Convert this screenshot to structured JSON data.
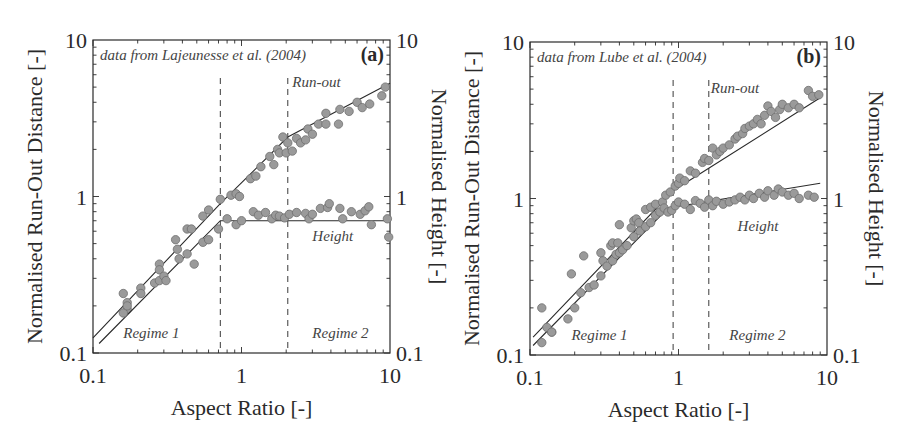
{
  "chart_data": [
    {
      "id": "a",
      "type": "scatter",
      "panel_label": "(a)",
      "source_note": "data from Lajeunesse et al. (2004)",
      "xlabel": "Aspect Ratio [-]",
      "ylabel_left": "Normalised Run-Out Distance [-]",
      "ylabel_right": "Normalised Height [-]",
      "xscale": "log",
      "yscale": "log",
      "xlim": [
        0.1,
        10
      ],
      "ylim": [
        0.1,
        10
      ],
      "x_ticks": [
        "0.1",
        "1",
        "10"
      ],
      "y_ticks_left": [
        "0.1",
        "1",
        "10"
      ],
      "y_ticks_right": [
        "0.1",
        "1",
        "10"
      ],
      "grid": false,
      "regime_boundaries": [
        0.72,
        2.05
      ],
      "annotations": [
        {
          "text": "Run-out",
          "x": 2.2,
          "y": 5.0
        },
        {
          "text": "Height",
          "x": 3.0,
          "y": 0.52
        },
        {
          "text": "Regime 1",
          "x": 0.16,
          "y": 0.125
        },
        {
          "text": "Regime 2",
          "x": 3.0,
          "y": 0.125
        }
      ],
      "series": [
        {
          "name": "Run-out",
          "fit": [
            [
              0.1,
              0.125
            ],
            [
              0.72,
              0.9
            ],
            [
              2.05,
              2.4
            ],
            [
              10,
              5.3
            ]
          ],
          "points": [
            [
              0.16,
              0.24
            ],
            [
              0.17,
              0.21
            ],
            [
              0.17,
              0.19
            ],
            [
              0.21,
              0.26
            ],
            [
              0.28,
              0.37
            ],
            [
              0.28,
              0.34
            ],
            [
              0.36,
              0.53
            ],
            [
              0.37,
              0.46
            ],
            [
              0.43,
              0.62
            ],
            [
              0.46,
              0.62
            ],
            [
              0.55,
              0.75
            ],
            [
              0.6,
              0.82
            ],
            [
              0.72,
              0.96
            ],
            [
              0.85,
              1.02
            ],
            [
              0.92,
              1.04
            ],
            [
              0.97,
              1.0
            ],
            [
              1.15,
              1.3
            ],
            [
              1.25,
              1.35
            ],
            [
              1.35,
              1.55
            ],
            [
              1.55,
              1.8
            ],
            [
              1.65,
              1.6
            ],
            [
              1.75,
              2.0
            ],
            [
              1.8,
              1.9
            ],
            [
              1.9,
              2.4
            ],
            [
              2.0,
              1.9
            ],
            [
              2.05,
              2.2
            ],
            [
              2.2,
              1.95
            ],
            [
              2.35,
              2.35
            ],
            [
              2.5,
              2.2
            ],
            [
              2.7,
              2.3
            ],
            [
              2.8,
              2.7
            ],
            [
              3.0,
              2.5
            ],
            [
              3.3,
              2.9
            ],
            [
              3.7,
              3.4
            ],
            [
              3.7,
              2.9
            ],
            [
              4.5,
              2.9
            ],
            [
              4.6,
              3.6
            ],
            [
              5.3,
              3.5
            ],
            [
              6.0,
              4.0
            ],
            [
              6.5,
              3.7
            ],
            [
              7.3,
              3.9
            ],
            [
              8.8,
              4.4
            ],
            [
              9.3,
              5.0
            ]
          ]
        },
        {
          "name": "Height",
          "fit": [
            [
              0.11,
              0.115
            ],
            [
              0.72,
              0.7
            ],
            [
              10,
              0.7
            ]
          ],
          "points": [
            [
              0.16,
              0.18
            ],
            [
              0.17,
              0.2
            ],
            [
              0.21,
              0.24
            ],
            [
              0.26,
              0.28
            ],
            [
              0.28,
              0.29
            ],
            [
              0.3,
              0.31
            ],
            [
              0.31,
              0.29
            ],
            [
              0.38,
              0.4
            ],
            [
              0.43,
              0.43
            ],
            [
              0.48,
              0.37
            ],
            [
              0.55,
              0.51
            ],
            [
              0.6,
              0.53
            ],
            [
              0.7,
              0.62
            ],
            [
              0.8,
              0.72
            ],
            [
              0.92,
              0.66
            ],
            [
              1.0,
              0.7
            ],
            [
              1.2,
              0.8
            ],
            [
              1.3,
              0.76
            ],
            [
              1.45,
              0.79
            ],
            [
              1.6,
              0.72
            ],
            [
              1.7,
              0.76
            ],
            [
              1.8,
              0.75
            ],
            [
              1.95,
              0.73
            ],
            [
              2.1,
              0.77
            ],
            [
              2.35,
              0.79
            ],
            [
              2.7,
              0.78
            ],
            [
              2.85,
              0.72
            ],
            [
              3.0,
              0.77
            ],
            [
              3.4,
              0.84
            ],
            [
              3.8,
              0.85
            ],
            [
              3.9,
              0.9
            ],
            [
              4.6,
              0.84
            ],
            [
              4.8,
              0.72
            ],
            [
              5.5,
              0.8
            ],
            [
              6.3,
              0.77
            ],
            [
              6.8,
              0.81
            ],
            [
              7.2,
              0.86
            ],
            [
              7.5,
              0.66
            ],
            [
              9.6,
              0.72
            ],
            [
              9.8,
              0.55
            ]
          ]
        }
      ]
    },
    {
      "id": "b",
      "type": "scatter",
      "panel_label": "(b)",
      "source_note": "data from Lube et al. (2004)",
      "xlabel": "Aspect Ratio [-]",
      "ylabel_left": "Normalised Run-Out Distance [-]",
      "ylabel_right": "Normalised Height [-]",
      "xscale": "log",
      "yscale": "log",
      "xlim": [
        0.1,
        10
      ],
      "ylim": [
        0.1,
        10
      ],
      "x_ticks": [
        "0.1",
        "1",
        "10"
      ],
      "y_ticks_left": [
        "0.1",
        "1",
        "10"
      ],
      "y_ticks_right": [
        "0.1",
        "1",
        "10"
      ],
      "grid": false,
      "regime_boundaries": [
        0.92,
        1.6
      ],
      "annotations": [
        {
          "text": "Run-out",
          "x": 1.65,
          "y": 4.7
        },
        {
          "text": "Height",
          "x": 2.5,
          "y": 0.62
        },
        {
          "text": "Regime 1",
          "x": 0.19,
          "y": 0.125
        },
        {
          "text": "Regime 2",
          "x": 2.2,
          "y": 0.125
        }
      ],
      "series": [
        {
          "name": "Run-out",
          "fit": [
            [
              0.105,
              0.13
            ],
            [
              0.92,
              1.12
            ],
            [
              9.0,
              4.4
            ]
          ],
          "points": [
            [
              0.12,
              0.2
            ],
            [
              0.14,
              0.14
            ],
            [
              0.19,
              0.33
            ],
            [
              0.23,
              0.43
            ],
            [
              0.3,
              0.45
            ],
            [
              0.31,
              0.4
            ],
            [
              0.35,
              0.5
            ],
            [
              0.36,
              0.52
            ],
            [
              0.39,
              0.52
            ],
            [
              0.4,
              0.68
            ],
            [
              0.48,
              0.65
            ],
            [
              0.5,
              0.72
            ],
            [
              0.52,
              0.74
            ],
            [
              0.54,
              0.7
            ],
            [
              0.6,
              0.85
            ],
            [
              0.65,
              0.88
            ],
            [
              0.7,
              0.92
            ],
            [
              0.78,
              0.95
            ],
            [
              0.82,
              1.05
            ],
            [
              0.88,
              1.1
            ],
            [
              0.95,
              1.2
            ],
            [
              1.0,
              1.25
            ],
            [
              1.02,
              1.35
            ],
            [
              1.1,
              1.3
            ],
            [
              1.2,
              1.5
            ],
            [
              1.3,
              1.45
            ],
            [
              1.45,
              1.7
            ],
            [
              1.5,
              1.8
            ],
            [
              1.6,
              1.75
            ],
            [
              1.7,
              2.1
            ],
            [
              1.8,
              1.9
            ],
            [
              1.9,
              2.0
            ],
            [
              2.0,
              2.1
            ],
            [
              2.2,
              2.2
            ],
            [
              2.4,
              2.4
            ],
            [
              2.5,
              2.5
            ],
            [
              2.7,
              2.6
            ],
            [
              2.8,
              2.8
            ],
            [
              3.0,
              2.9
            ],
            [
              3.2,
              3.0
            ],
            [
              3.4,
              3.2
            ],
            [
              3.6,
              3.0
            ],
            [
              3.8,
              3.4
            ],
            [
              4.0,
              3.9
            ],
            [
              4.2,
              3.6
            ],
            [
              4.5,
              3.3
            ],
            [
              4.8,
              3.7
            ],
            [
              5.0,
              4.0
            ],
            [
              5.5,
              3.8
            ],
            [
              6.0,
              4.0
            ],
            [
              6.5,
              3.8
            ],
            [
              7.5,
              4.9
            ],
            [
              8.0,
              4.5
            ],
            [
              8.8,
              4.6
            ]
          ]
        },
        {
          "name": "Height",
          "fit": [
            [
              0.105,
              0.115
            ],
            [
              0.85,
              0.87
            ],
            [
              9.0,
              1.25
            ]
          ],
          "points": [
            [
              0.12,
              0.12
            ],
            [
              0.13,
              0.15
            ],
            [
              0.14,
              0.14
            ],
            [
              0.18,
              0.17
            ],
            [
              0.2,
              0.2
            ],
            [
              0.22,
              0.25
            ],
            [
              0.25,
              0.27
            ],
            [
              0.27,
              0.28
            ],
            [
              0.3,
              0.32
            ],
            [
              0.33,
              0.37
            ],
            [
              0.36,
              0.4
            ],
            [
              0.38,
              0.44
            ],
            [
              0.4,
              0.45
            ],
            [
              0.42,
              0.47
            ],
            [
              0.45,
              0.5
            ],
            [
              0.5,
              0.57
            ],
            [
              0.55,
              0.62
            ],
            [
              0.6,
              0.66
            ],
            [
              0.65,
              0.7
            ],
            [
              0.7,
              0.78
            ],
            [
              0.75,
              0.82
            ],
            [
              0.8,
              0.87
            ],
            [
              0.85,
              0.82
            ],
            [
              0.9,
              0.84
            ],
            [
              0.95,
              0.9
            ],
            [
              1.0,
              0.95
            ],
            [
              1.1,
              0.92
            ],
            [
              1.2,
              0.85
            ],
            [
              1.3,
              0.97
            ],
            [
              1.4,
              0.93
            ],
            [
              1.5,
              0.88
            ],
            [
              1.6,
              0.98
            ],
            [
              1.7,
              0.9
            ],
            [
              1.8,
              0.96
            ],
            [
              2.0,
              0.92
            ],
            [
              2.2,
              0.95
            ],
            [
              2.4,
              0.98
            ],
            [
              2.6,
              1.02
            ],
            [
              2.8,
              0.98
            ],
            [
              3.0,
              1.05
            ],
            [
              3.2,
              1.0
            ],
            [
              3.5,
              1.08
            ],
            [
              3.8,
              1.02
            ],
            [
              4.0,
              1.12
            ],
            [
              4.4,
              1.05
            ],
            [
              4.7,
              1.15
            ],
            [
              5.0,
              1.1
            ],
            [
              5.5,
              1.05
            ],
            [
              6.0,
              1.08
            ],
            [
              6.5,
              1.0
            ],
            [
              7.5,
              1.05
            ],
            [
              8.2,
              1.02
            ]
          ]
        }
      ]
    }
  ],
  "style": {
    "point_fill": "#9a9a9a",
    "point_stroke": "#6e6e6e",
    "line_color": "#2a2a2a",
    "dash_color": "#3a3a3a"
  }
}
